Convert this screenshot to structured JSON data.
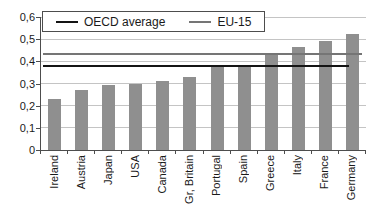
{
  "chart_data": {
    "type": "bar",
    "title": "",
    "xlabel": "",
    "ylabel": "",
    "categories": [
      "Ireland",
      "Austria",
      "Japan",
      "USA",
      "Canada",
      "Gr, Britain",
      "Portugal",
      "Spain",
      "Greece",
      "Italy",
      "France",
      "Germany"
    ],
    "values": [
      0.23,
      0.27,
      0.295,
      0.3,
      0.31,
      0.33,
      0.375,
      0.375,
      0.435,
      0.465,
      0.49,
      0.525
    ],
    "reference_lines": [
      {
        "name": "OECD average",
        "value": 0.378
      },
      {
        "name": "EU-15",
        "value": 0.435
      }
    ],
    "ylim": [
      0,
      0.6
    ],
    "ytick_interval": 0.1,
    "ytick_labels": [
      "0",
      "0,1",
      "0,2",
      "0,3",
      "0,4",
      "0,5",
      "0,6"
    ],
    "grid": "horizontal",
    "legend_position": "top-left"
  },
  "colors": {
    "background": "#ffffff",
    "bar": "#8f8f8f",
    "grid": "#c4c4c4",
    "axis": "#4d4d4d",
    "oecd_line": "#141414",
    "eu15_line": "#757575",
    "text": "#1a1a1a"
  }
}
